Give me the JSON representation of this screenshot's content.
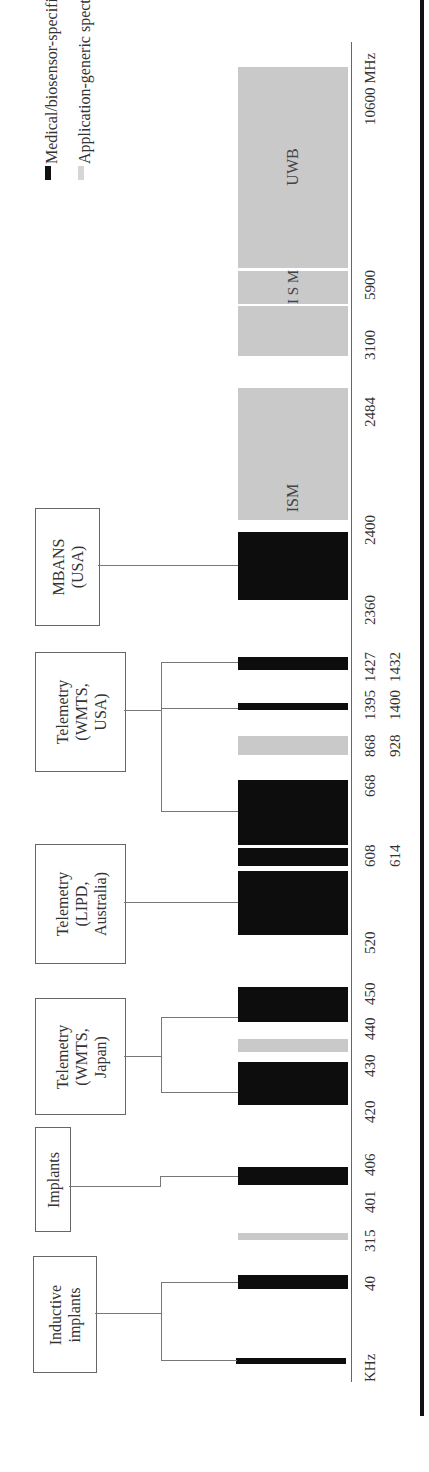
{
  "legend": [
    {
      "label": "Medical/biosensor-specific spectrum",
      "color": "#0d0d0d"
    },
    {
      "label": "Application-generic spectrum",
      "color": "#c9c9c9"
    }
  ],
  "axis": {
    "start_unit": "KHz",
    "end_unit": "MHz",
    "ticks": [
      {
        "label": "KHz",
        "row": 1
      },
      {
        "label": "40",
        "row": 1
      },
      {
        "label": "315",
        "row": 1
      },
      {
        "label": "401",
        "row": 1
      },
      {
        "label": "406",
        "row": 1
      },
      {
        "label": "420",
        "row": 1
      },
      {
        "label": "430",
        "row": 1
      },
      {
        "label": "440",
        "row": 1
      },
      {
        "label": "450",
        "row": 1
      },
      {
        "label": "520",
        "row": 1
      },
      {
        "label": "608",
        "row": 1
      },
      {
        "label": "614",
        "row": 2
      },
      {
        "label": "668",
        "row": 1
      },
      {
        "label": "868",
        "row": 1
      },
      {
        "label": "928",
        "row": 2
      },
      {
        "label": "1395",
        "row": 1
      },
      {
        "label": "1400",
        "row": 2
      },
      {
        "label": "1427",
        "row": 1
      },
      {
        "label": "1432",
        "row": 2
      },
      {
        "label": "2360",
        "row": 1
      },
      {
        "label": "2400",
        "row": 1
      },
      {
        "label": "2484",
        "row": 1
      },
      {
        "label": "3100",
        "row": 1
      },
      {
        "label": "5900",
        "row": 1
      },
      {
        "label": "10600 MHz",
        "row": 1
      }
    ]
  },
  "groups": [
    {
      "label": "Inductive\nimplants",
      "bands": [
        "KHz band",
        "40 KHz band"
      ]
    },
    {
      "label": "Implants",
      "bands": [
        "401–406 MHz"
      ]
    },
    {
      "label": "Telemetry\n(WMTS,\nJapan)",
      "bands": [
        "420–430 MHz",
        "440–450 MHz"
      ]
    },
    {
      "label": "Telemetry\n(LIPD,\nAustralia)",
      "bands": [
        "520–668 MHz"
      ]
    },
    {
      "label": "Telemetry\n(WMTS,\nUSA)",
      "bands": [
        "608–614 MHz",
        "1395–1400 MHz",
        "1427–1432 MHz"
      ]
    },
    {
      "label": "MBANS\n(USA)",
      "bands": [
        "2360–2400 MHz"
      ]
    }
  ],
  "bands": [
    {
      "range": "KHz",
      "type": "medical"
    },
    {
      "range": "40",
      "type": "medical"
    },
    {
      "range": "315",
      "type": "generic"
    },
    {
      "range": "401–406",
      "type": "medical"
    },
    {
      "range": "420–430",
      "type": "medical"
    },
    {
      "range": "430–440",
      "type": "generic"
    },
    {
      "range": "440–450",
      "type": "medical"
    },
    {
      "range": "520–608",
      "type": "medical"
    },
    {
      "range": "608–614",
      "type": "medical"
    },
    {
      "range": "614–668",
      "type": "medical"
    },
    {
      "range": "868–928",
      "type": "generic"
    },
    {
      "range": "1395–1400",
      "type": "medical"
    },
    {
      "range": "1427–1432",
      "type": "medical"
    },
    {
      "range": "2360–2400",
      "type": "medical"
    },
    {
      "range": "2400–2484",
      "type": "generic",
      "label": "ISM"
    },
    {
      "range": "3100–5900",
      "type": "generic"
    },
    {
      "range": "5900 ISM",
      "type": "generic",
      "label": "I\nS\nM"
    },
    {
      "range": "5900–10600",
      "type": "generic",
      "label": "UWB"
    }
  ],
  "band_labels": {
    "ism": "ISM",
    "ism_stacked": "I S M",
    "uwb": "UWB"
  }
}
